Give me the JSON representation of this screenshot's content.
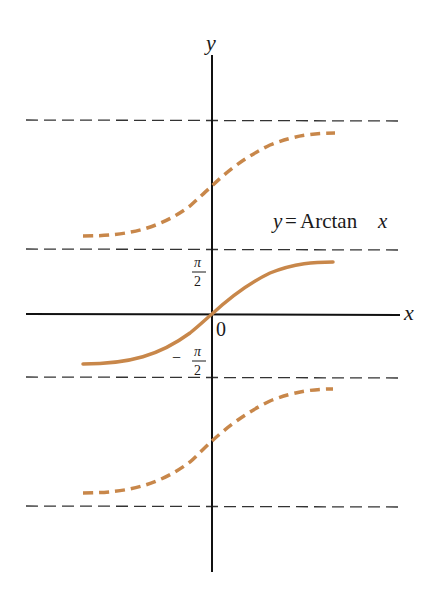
{
  "figure": {
    "title": "y = Arctan x",
    "axes": {
      "x_label": "x",
      "y_label": "y",
      "origin_label": "0"
    },
    "tick_labels": {
      "upper": {
        "numerator": "π",
        "denominator": "2",
        "sign": ""
      },
      "lower": {
        "numerator": "π",
        "denominator": "2",
        "sign": "−"
      }
    },
    "curve_label": {
      "lhs": "y",
      "eq": "=",
      "func": "Arctan",
      "var": "x"
    },
    "colors": {
      "curve": "#C8874A",
      "axis": "#111111",
      "asymptote": "#333333"
    },
    "asymptotes": [
      "y = 3π/2",
      "y = π/2",
      "y = −π/2",
      "y = −3π/2"
    ],
    "branches": [
      {
        "name": "upper-branch",
        "range": "(π/2, 3π/2)",
        "style": "dashed"
      },
      {
        "name": "principal-branch",
        "range": "(−π/2, π/2)",
        "style": "solid"
      },
      {
        "name": "lower-branch",
        "range": "(−3π/2, −π/2)",
        "style": "dashed"
      }
    ]
  }
}
